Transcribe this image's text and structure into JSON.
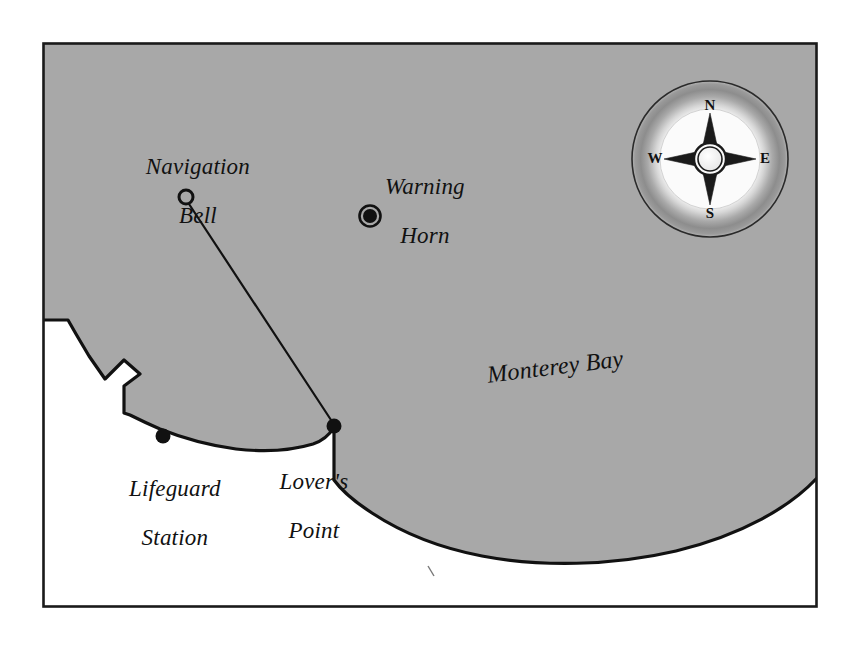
{
  "map": {
    "title": "Monterey Bay coastal map",
    "frame": {
      "x": 42,
      "y": 42,
      "width": 776,
      "height": 566,
      "stroke": "#1a1a1a"
    },
    "colors": {
      "water_fill": "#a8a8a8",
      "land_fill": "#ffffff",
      "coastline_stroke": "#111111",
      "page_background": "#ffffff",
      "text": "#111111"
    },
    "water_labels": [
      {
        "name": "monterey-bay",
        "text": "Monterey Bay",
        "x": 543,
        "y": 344,
        "rotation": -7
      }
    ],
    "place_labels": [
      {
        "name": "navigation-bell",
        "line1": "Navigation",
        "line2": "Bell",
        "x": 186,
        "y": 155
      },
      {
        "name": "warning-horn",
        "line1": "Warning",
        "line2": "Horn",
        "x": 413,
        "y": 176
      },
      {
        "name": "lifeguard-station",
        "line1": "Lifeguard",
        "line2": "Station",
        "x": 163,
        "y": 487
      },
      {
        "name": "lovers-point",
        "line1": "Lover's",
        "line2": "Point",
        "x": 302,
        "y": 480
      }
    ],
    "markers": [
      {
        "name": "navigation-bell-marker",
        "type": "hollow-circle",
        "x": 186,
        "y": 197,
        "radius": 7
      },
      {
        "name": "warning-horn-marker",
        "type": "ringed-dot",
        "x": 370,
        "y": 216,
        "radius": 8
      },
      {
        "name": "lifeguard-station-marker",
        "type": "filled-dot",
        "x": 163,
        "y": 436,
        "radius": 7
      },
      {
        "name": "lovers-point-marker",
        "type": "filled-dot",
        "x": 334,
        "y": 426,
        "radius": 7
      }
    ],
    "connector": {
      "name": "bell-to-point-line",
      "from": "navigation-bell-marker",
      "to": "lovers-point-marker",
      "x1": 189,
      "y1": 204,
      "x2": 333,
      "y2": 423
    },
    "compass": {
      "name": "compass-rose",
      "center_x": 710,
      "center_y": 159,
      "outer_radius": 78,
      "north": "N",
      "east": "E",
      "south": "S",
      "west": "W"
    }
  }
}
